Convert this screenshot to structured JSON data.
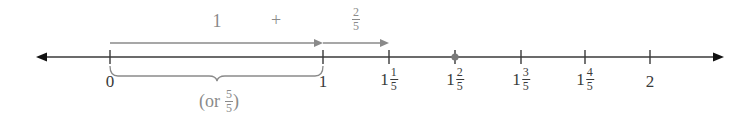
{
  "diagram": {
    "type": "number-line",
    "colors": {
      "axis": "#3a3a3a",
      "annotation": "#8a8a8a",
      "highlight_point": "#7a7a7a",
      "background": "#ffffff"
    },
    "axis": {
      "min": 0,
      "max": 2,
      "arrows": "both"
    },
    "ticks": [
      {
        "value": 0,
        "whole": "0",
        "num": "",
        "den": ""
      },
      {
        "value": 1,
        "whole": "1",
        "num": "",
        "den": ""
      },
      {
        "value": 1.2,
        "whole": "1",
        "num": "1",
        "den": "5"
      },
      {
        "value": 1.4,
        "whole": "1",
        "num": "2",
        "den": "5"
      },
      {
        "value": 1.6,
        "whole": "1",
        "num": "3",
        "den": "5"
      },
      {
        "value": 1.8,
        "whole": "1",
        "num": "4",
        "den": "5"
      },
      {
        "value": 2,
        "whole": "2",
        "num": "",
        "den": ""
      }
    ],
    "highlighted_point": {
      "value": 1.4,
      "label": "1 2/5"
    },
    "jumps": [
      {
        "from": 0,
        "to": 1,
        "label": "1"
      },
      {
        "from": 1,
        "to": 1.2,
        "label_num": "2",
        "label_den": "5"
      }
    ],
    "operator": "+",
    "brace": {
      "from": 0,
      "to": 1,
      "label_prefix": "(or",
      "label_num": "5",
      "label_den": "5",
      "label_suffix": ")"
    }
  }
}
